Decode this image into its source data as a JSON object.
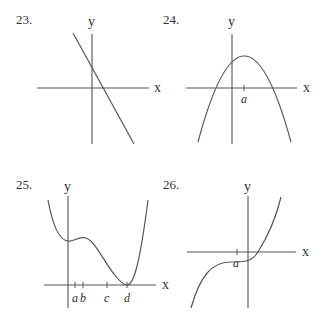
{
  "problems": [
    {
      "number": "23.",
      "x_label": "x",
      "y_label": "y",
      "description": "Decreasing straight line with positive y-intercept and positive x-intercept"
    },
    {
      "number": "24.",
      "x_label": "x",
      "y_label": "y",
      "tick_labels": [
        "a"
      ],
      "description": "Downward-opening parabola with maximum at x = a"
    },
    {
      "number": "25.",
      "x_label": "x",
      "y_label": "y",
      "tick_labels": [
        "a",
        "b",
        "c",
        "d"
      ],
      "description": "Quartic-like curve with shoulder near a, b and minimum touching x-axis at d"
    },
    {
      "number": "26.",
      "x_label": "x",
      "y_label": "y",
      "tick_labels": [
        "a"
      ],
      "description": "Cubic-like increasing curve with horizontal inflection at x = a below x-axis"
    }
  ]
}
